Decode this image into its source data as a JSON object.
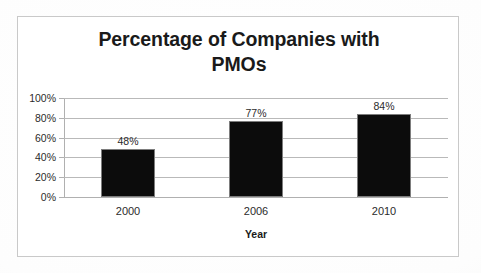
{
  "chart_data": {
    "type": "bar",
    "title": "Percentage of Companies with PMOs",
    "title_lines": [
      "Percentage of Companies with",
      "PMOs"
    ],
    "categories": [
      "2000",
      "2006",
      "2010"
    ],
    "values": [
      48,
      77,
      84
    ],
    "value_labels": [
      "48%",
      "77%",
      "84%"
    ],
    "xlabel": "Year",
    "ylabel": "",
    "ylim": [
      0,
      100
    ],
    "ytick_values": [
      100,
      80,
      60,
      40,
      20,
      0
    ],
    "ytick_labels": [
      "100%",
      "80%",
      "60%",
      "40%",
      "20%",
      "0%"
    ],
    "grid": true,
    "legend": null,
    "bar_color": "#0c0c0c",
    "bar_edge_color": "#7d7d7d",
    "gridline_color": "#b9b9b9",
    "axis_color": "#b0b0b0",
    "text_color": "#2b2b2b",
    "border_color": "#c9c9c9",
    "background_color": "#ffffff"
  }
}
